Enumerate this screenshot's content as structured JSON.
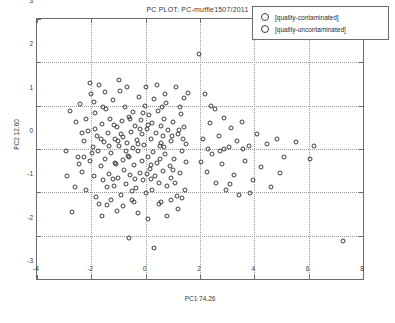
{
  "chart_data": {
    "type": "scatter",
    "title": "PC PLOT: PC-muffle1507/2011",
    "xlabel": "PC1 74.26",
    "ylabel": "PC2 12.60",
    "xlim": [
      -4,
      8
    ],
    "ylim": [
      -3,
      3
    ],
    "xticks": [
      -4,
      -2,
      0,
      2,
      4,
      6,
      8
    ],
    "xticklabels": [
      "-4",
      "-2",
      "0",
      "2",
      "4",
      "6",
      "8"
    ],
    "yticks": [
      -3,
      -2,
      -1,
      0,
      1,
      2,
      3
    ],
    "yticklabels": [
      "-3",
      "-2",
      "-1",
      "0",
      "1",
      "2",
      "3"
    ],
    "grid": true,
    "legend_position": "top-right",
    "marker": "open-circle",
    "marker_color": "#3d3d3d",
    "series": [
      {
        "name": "[quality-contaminated]",
        "points": [
          [
            -2.95,
            -0.05
          ],
          [
            -2.72,
            -1.45
          ],
          [
            -2.55,
            0.62
          ],
          [
            -2.48,
            -0.18
          ],
          [
            -2.4,
            1.04
          ],
          [
            -2.33,
            -0.52
          ],
          [
            -2.28,
            0.18
          ],
          [
            -2.2,
            -0.95
          ],
          [
            -2.12,
            0.42
          ],
          [
            -2.05,
            -0.28
          ],
          [
            -2.0,
            1.28
          ],
          [
            -1.95,
            0.05
          ],
          [
            -1.9,
            -0.62
          ],
          [
            -1.86,
            0.82
          ],
          [
            -1.82,
            -1.1
          ],
          [
            -1.78,
            0.3
          ],
          [
            -1.74,
            -0.05
          ],
          [
            -1.7,
            1.48
          ],
          [
            -1.66,
            -0.4
          ],
          [
            -1.62,
            0.58
          ],
          [
            -1.58,
            -0.72
          ],
          [
            -1.54,
            0.16
          ],
          [
            -1.5,
            -0.22
          ],
          [
            -1.46,
            0.92
          ],
          [
            -1.42,
            -1.3
          ],
          [
            -1.38,
            0.36
          ],
          [
            -1.34,
            -0.58
          ],
          [
            -1.3,
            0.7
          ],
          [
            -1.26,
            -0.1
          ],
          [
            -1.22,
            1.12
          ],
          [
            -1.18,
            -0.85
          ],
          [
            -1.14,
            0.24
          ],
          [
            -1.1,
            -0.35
          ],
          [
            -1.06,
            0.5
          ],
          [
            -1.02,
            -0.68
          ],
          [
            -0.98,
            0.08
          ],
          [
            -0.95,
            1.34
          ],
          [
            -0.92,
            -1.05
          ],
          [
            -0.88,
            0.64
          ],
          [
            -0.85,
            -0.25
          ],
          [
            -0.82,
            0.28
          ],
          [
            -0.78,
            -0.48
          ],
          [
            -0.75,
            0.96
          ],
          [
            -0.72,
            -0.8
          ],
          [
            -0.68,
            0.14
          ],
          [
            -0.65,
            -0.15
          ],
          [
            -0.62,
            0.74
          ],
          [
            -0.58,
            -0.6
          ],
          [
            -0.55,
            0.4
          ],
          [
            -0.52,
            -1.18
          ],
          [
            -0.48,
            0.02
          ],
          [
            -0.45,
            0.86
          ],
          [
            -0.42,
            -0.38
          ],
          [
            -0.38,
            0.54
          ],
          [
            -0.35,
            -0.9
          ],
          [
            -0.32,
            0.2
          ],
          [
            -0.28,
            -0.05
          ],
          [
            -0.25,
            1.2
          ],
          [
            -0.22,
            -0.55
          ],
          [
            -0.18,
            0.68
          ],
          [
            -0.15,
            -0.28
          ],
          [
            -0.12,
            0.34
          ],
          [
            -0.08,
            -0.72
          ],
          [
            -0.05,
            0.1
          ],
          [
            -0.02,
            1.0
          ],
          [
            0.02,
            -1.02
          ],
          [
            0.05,
            0.46
          ],
          [
            0.08,
            -0.18
          ],
          [
            0.12,
            0.78
          ],
          [
            0.15,
            -0.45
          ],
          [
            0.18,
            0.24
          ],
          [
            0.22,
            -0.95
          ],
          [
            0.25,
            0.6
          ],
          [
            0.28,
            -0.08
          ],
          [
            0.32,
            1.16
          ],
          [
            0.35,
            -0.62
          ],
          [
            0.38,
            0.38
          ],
          [
            0.42,
            -0.32
          ],
          [
            0.45,
            0.88
          ],
          [
            0.48,
            -0.78
          ],
          [
            0.52,
            0.06
          ],
          [
            0.55,
            0.52
          ],
          [
            0.58,
            -1.22
          ],
          [
            0.62,
            0.3
          ],
          [
            0.65,
            -0.5
          ],
          [
            0.68,
            0.7
          ],
          [
            0.72,
            -0.12
          ],
          [
            0.75,
            1.06
          ],
          [
            0.78,
            -0.85
          ],
          [
            0.82,
            0.44
          ],
          [
            0.88,
            -0.4
          ],
          [
            0.92,
            0.18
          ],
          [
            0.95,
            -0.66
          ],
          [
            1.0,
            0.62
          ],
          [
            1.05,
            -0.22
          ],
          [
            1.1,
            1.42
          ],
          [
            1.15,
            -1.08
          ],
          [
            1.2,
            0.34
          ],
          [
            1.25,
            -0.55
          ],
          [
            1.3,
            0.8
          ],
          [
            1.35,
            -0.05
          ],
          [
            1.4,
            0.5
          ],
          [
            1.45,
            -0.95
          ],
          [
            1.5,
            0.12
          ],
          [
            1.55,
            1.3
          ],
          [
            -2.6,
            -0.88
          ],
          [
            -2.18,
            0.7
          ],
          [
            -1.92,
            1.08
          ],
          [
            -1.62,
            -1.55
          ],
          [
            -1.35,
            0.06
          ],
          [
            -1.05,
            -1.42
          ],
          [
            -0.7,
            1.42
          ],
          [
            -0.3,
            -1.48
          ],
          [
            0.1,
            -1.62
          ],
          [
            0.4,
            1.48
          ],
          [
            0.8,
            -1.55
          ],
          [
            1.18,
            -1.38
          ],
          [
            1.42,
            1.18
          ],
          [
            -0.6,
            -2.05
          ],
          [
            0.3,
            -2.28
          ],
          [
            -2.35,
            0.36
          ],
          [
            -1.98,
            -0.1
          ],
          [
            -1.56,
            0.98
          ],
          [
            -1.2,
            -0.7
          ],
          [
            -0.9,
            0.34
          ],
          [
            -0.5,
            -0.98
          ],
          [
            -0.1,
            0.84
          ],
          [
            0.2,
            -0.7
          ],
          [
            0.6,
            0.96
          ],
          [
            1.08,
            -0.78
          ],
          [
            -2.8,
            0.88
          ],
          [
            -2.05,
            1.52
          ],
          [
            -1.48,
            1.32
          ],
          [
            -0.98,
            1.6
          ],
          [
            0.02,
            1.42
          ],
          [
            0.72,
            1.28
          ],
          [
            1.28,
            0.98
          ],
          [
            -1.72,
            -1.28
          ],
          [
            -1.28,
            -1.18
          ],
          [
            -0.82,
            -1.32
          ],
          [
            -0.42,
            -1.22
          ],
          [
            0.48,
            -1.28
          ],
          [
            0.92,
            -1.18
          ],
          [
            1.32,
            -1.12
          ],
          [
            -2.45,
            -0.35
          ],
          [
            -1.88,
            0.46
          ],
          [
            -1.44,
            -0.88
          ],
          [
            -1.02,
            0.18
          ],
          [
            -0.62,
            -0.18
          ],
          [
            -0.2,
            0.46
          ],
          [
            0.18,
            -0.36
          ],
          [
            0.58,
            0.14
          ],
          [
            1.0,
            -0.48
          ],
          [
            1.38,
            0.24
          ],
          [
            -1.16,
            0.56
          ],
          [
            -0.72,
            -0.05
          ],
          [
            -0.28,
            0.12
          ],
          [
            0.08,
            0.56
          ],
          [
            0.52,
            -0.22
          ],
          [
            0.98,
            0.3
          ],
          [
            -2.88,
            -0.62
          ],
          [
            -2.26,
            -0.18
          ],
          [
            -1.64,
            0.24
          ],
          [
            -1.12,
            -0.32
          ],
          [
            -0.56,
            0.7
          ],
          [
            0.06,
            -0.58
          ],
          [
            0.66,
            0.04
          ],
          [
            1.22,
            0.44
          ],
          [
            1.48,
            -0.3
          ],
          [
            -0.38,
            -0.7
          ]
        ]
      },
      {
        "name": "[quality-uncontaminated]",
        "points": [
          [
            1.95,
            2.2
          ],
          [
            2.1,
            0.22
          ],
          [
            2.25,
            -0.52
          ],
          [
            2.35,
            0.6
          ],
          [
            2.45,
            -0.12
          ],
          [
            2.55,
            0.92
          ],
          [
            2.6,
            -0.78
          ],
          [
            2.7,
            0.3
          ],
          [
            2.8,
            -0.35
          ],
          [
            2.88,
            0.72
          ],
          [
            2.95,
            -0.95
          ],
          [
            3.05,
            0.04
          ],
          [
            3.15,
            0.48
          ],
          [
            3.25,
            -0.6
          ],
          [
            3.35,
            0.18
          ],
          [
            3.45,
            -1.05
          ],
          [
            3.55,
            0.62
          ],
          [
            3.65,
            -0.28
          ],
          [
            3.8,
            0.06
          ],
          [
            3.95,
            -0.72
          ],
          [
            4.1,
            0.34
          ],
          [
            4.25,
            -0.42
          ],
          [
            4.45,
            0.12
          ],
          [
            4.6,
            -0.88
          ],
          [
            4.85,
            0.22
          ],
          [
            5.1,
            -0.18
          ],
          [
            5.55,
            0.16
          ],
          [
            6.05,
            -0.24
          ],
          [
            6.2,
            0.08
          ],
          [
            7.25,
            -2.12
          ],
          [
            2.18,
            1.28
          ],
          [
            2.42,
            1.0
          ],
          [
            2.72,
            -0.05
          ],
          [
            3.1,
            -0.8
          ],
          [
            3.6,
            0.0
          ],
          [
            2.05,
            -0.3
          ],
          [
            2.3,
            0.0
          ],
          [
            2.9,
            0.0
          ],
          [
            3.85,
            -1.02
          ],
          [
            4.95,
            -0.55
          ]
        ]
      }
    ]
  },
  "legend": {
    "items": [
      {
        "label": "[quality-contaminated]"
      },
      {
        "label": "[quality-uncontaminated]"
      }
    ]
  }
}
